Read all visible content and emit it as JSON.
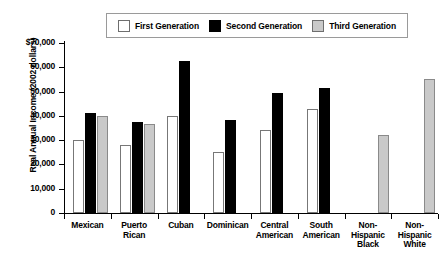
{
  "figure": {
    "title_sliver": "",
    "ylabel": "Real Annual Income (2002 dollars)"
  },
  "legend": {
    "entries": [
      {
        "label": "First Generation",
        "swatch": "white-square-icon",
        "color": "#ffffff"
      },
      {
        "label": "Second Generation",
        "swatch": "black-square-icon",
        "color": "#000000"
      },
      {
        "label": "Third Generation",
        "swatch": "gray-square-icon",
        "color": "#c9c9c9"
      }
    ]
  },
  "axis": {
    "y_ticks": [
      "$70,000",
      "60,000",
      "50,000",
      "40,000",
      "30,000",
      "20,000",
      "10,000",
      "0"
    ],
    "y_tick_values": [
      70000,
      60000,
      50000,
      40000,
      30000,
      20000,
      10000,
      0
    ]
  },
  "chart_data": {
    "type": "bar",
    "title": "",
    "xlabel": "",
    "ylabel": "Real Annual Income (2002 dollars)",
    "ylim": [
      0,
      70000
    ],
    "ytick_step": 10000,
    "grid": false,
    "legend_position": "top",
    "categories": [
      "Mexican",
      "Puerto Rican",
      "Cuban",
      "Dominican",
      "Central American",
      "South American",
      "Non-Hispanic Black",
      "Non-Hispanic White"
    ],
    "category_lines": [
      [
        "Mexican"
      ],
      [
        "Puerto",
        "Rican"
      ],
      [
        "Cuban"
      ],
      [
        "Dominican"
      ],
      [
        "Central",
        "American"
      ],
      [
        "South",
        "American"
      ],
      [
        "Non-",
        "Hispanic",
        "Black"
      ],
      [
        "Non-",
        "Hispanic",
        "White"
      ]
    ],
    "series": [
      {
        "name": "First Generation",
        "color": "#ffffff",
        "values": [
          30000,
          28000,
          40000,
          25000,
          34000,
          43000,
          null,
          null
        ]
      },
      {
        "name": "Second Generation",
        "color": "#000000",
        "values": [
          41000,
          37500,
          62500,
          38500,
          49500,
          51500,
          null,
          null
        ]
      },
      {
        "name": "Third Generation",
        "color": "#c9c9c9",
        "values": [
          40000,
          36500,
          null,
          null,
          null,
          null,
          32000,
          55000
        ]
      }
    ]
  }
}
